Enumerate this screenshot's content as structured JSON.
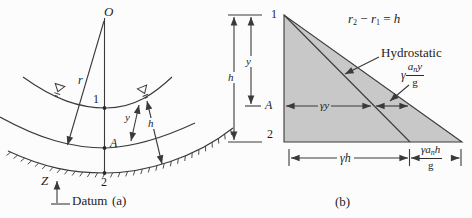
{
  "colors": {
    "background": "#fcfcfc",
    "line": "#3a3a3a",
    "triangle_fill": "#c8c8c8"
  },
  "figure_a": {
    "caption": "(a)",
    "labels": {
      "origin": "O",
      "radius": "r",
      "point1": "1",
      "pointA": "A",
      "point2": "2",
      "dim_y": "y",
      "dim_h": "h",
      "axis_z": "Z",
      "datum": "Datum"
    }
  },
  "figure_b": {
    "caption": "(b)",
    "relation": {
      "r1": "r",
      "s1": "2",
      "op": " − ",
      "r2": "r",
      "s2": "1",
      "eq": " = ",
      "h": "h"
    },
    "hydrostatic": "Hydrostatic",
    "labels": {
      "point1": "1",
      "pointA": "A",
      "point2": "2",
      "dim_y": "y",
      "dim_h": "h",
      "gamma_y": "γy",
      "gamma_h": "γh"
    },
    "accel_pressure_y": {
      "gamma": "γ",
      "a": "a",
      "n": "n",
      "v": "y",
      "den": "g"
    },
    "accel_pressure_h": {
      "gamma": "γ",
      "a": "a",
      "n": "n",
      "v": "h",
      "den": "g"
    }
  }
}
